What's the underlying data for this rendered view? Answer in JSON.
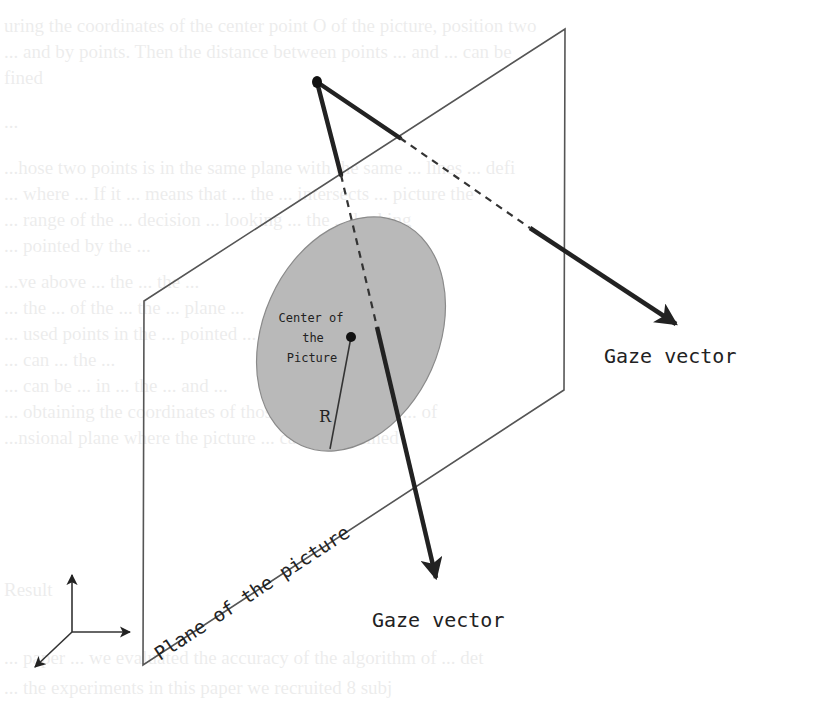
{
  "diagram": {
    "labels": {
      "center": [
        "Center of",
        "the",
        "Picture"
      ],
      "radius": "R",
      "gaze_right": "Gaze vector",
      "gaze_bottom": "Gaze vector",
      "plane": "Plane of the picture"
    },
    "colors": {
      "stroke": "#222222",
      "plane_edge": "#555555",
      "ellipse_fill": "#b9b9b9",
      "ellipse_edge": "#8a8a8a",
      "background": "#ffffff"
    },
    "geometry": {
      "plane_corners": [
        [
          565,
          29
        ],
        [
          564,
          390
        ],
        [
          143,
          665
        ],
        [
          144,
          301
        ]
      ],
      "eye_point": [
        317,
        82
      ],
      "ellipse": {
        "cx": 351,
        "cy": 334,
        "rx": 88,
        "ry": 122,
        "rotation": 24
      },
      "center_point": [
        351,
        337
      ],
      "radius_end": [
        330,
        449
      ],
      "gaze_right": {
        "start": [
          317,
          82
        ],
        "dash_start": [
          400,
          138
        ],
        "dash_end": [
          530,
          228
        ],
        "end": [
          680,
          327
        ]
      },
      "gaze_bottom": {
        "start": [
          317,
          82
        ],
        "dash_start": [
          341,
          175
        ],
        "dash_end": [
          377,
          327
        ],
        "end": [
          437,
          583
        ]
      },
      "axes_origin": [
        72,
        632
      ]
    },
    "background_bleed_text": [
      "uring the coordinates of the center point O of the picture, position two",
      "... and by points. Then the distance between points ... and ... can be",
      "fined",
      "...",
      "...hose two points is in the same plane with the same ... lines ... defi",
      "... where ... If it ... means that ... the ... intersects ... picture the",
      "... range of the ... decision ... looking ... the ... looking",
      "... pointed by the ...",
      "...ve above ... the ... the ...",
      "... the ... of the ... the ... plane ...",
      "... used points in the ... pointed ... points ... the pict",
      "... can ... the ...",
      "... can be ... in ... the ... and ...",
      "... obtaining the coordinates of those two points, the ... of",
      "...nsional plane where the picture ... can be obtained",
      "Result",
      "... paper ... we evaluated the accuracy of the algorithm of ... det",
      "... the experiments in this paper we recruited 8 subj"
    ]
  }
}
